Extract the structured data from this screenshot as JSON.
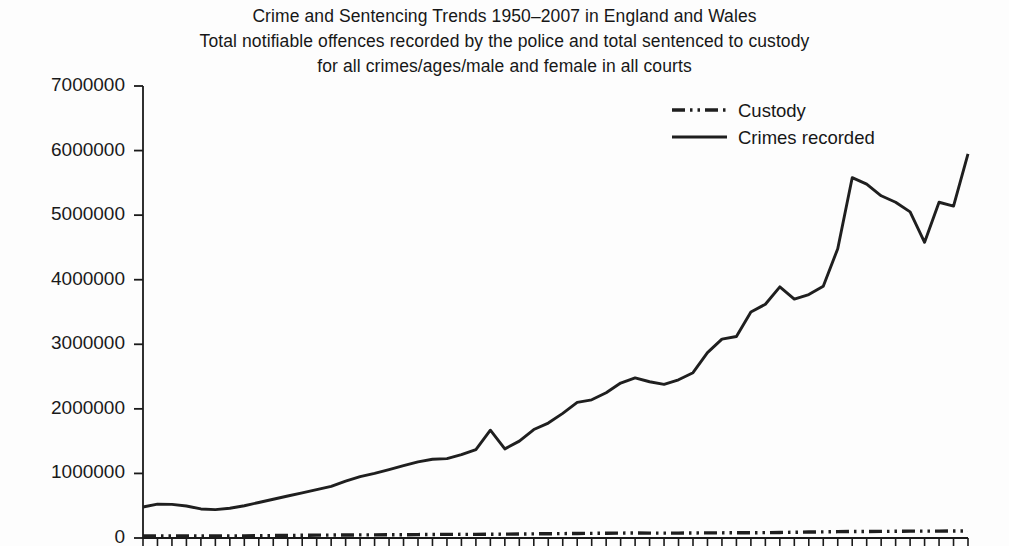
{
  "chart_data": {
    "type": "line",
    "title": "Crime and Sentencing Trends 1950–2007 in England and Wales",
    "subtitle_line2": "Total notifiable offences recorded by the police and total sentenced to custody",
    "subtitle_line3": "for all crimes/ages/male and female in all courts",
    "xlabel": "",
    "ylabel": "",
    "ylim": [
      0,
      7000000
    ],
    "xlim": [
      1950,
      2007
    ],
    "grid": false,
    "legend_position": "top-right",
    "ytick_labels": [
      "7000000",
      "6000000",
      "5000000",
      "4000000",
      "3000000",
      "2000000",
      "1000000",
      "0"
    ],
    "ytick_values": [
      7000000,
      6000000,
      5000000,
      4000000,
      3000000,
      2000000,
      1000000,
      0
    ],
    "x": [
      1950,
      1951,
      1952,
      1953,
      1954,
      1955,
      1956,
      1957,
      1958,
      1959,
      1960,
      1961,
      1962,
      1963,
      1964,
      1965,
      1966,
      1967,
      1968,
      1969,
      1970,
      1971,
      1972,
      1973,
      1974,
      1975,
      1976,
      1977,
      1978,
      1979,
      1980,
      1981,
      1982,
      1983,
      1984,
      1985,
      1986,
      1987,
      1988,
      1989,
      1990,
      1991,
      1992,
      1993,
      1994,
      1995,
      1996,
      1997,
      1998,
      1999,
      2000,
      2001,
      2002,
      2003,
      2004,
      2005,
      2006,
      2007
    ],
    "series": [
      {
        "name": "Crimes recorded",
        "style": "solid",
        "color": "#1f1f1f",
        "values": [
          480000,
          525000,
          520000,
          495000,
          450000,
          440000,
          460000,
          500000,
          550000,
          600000,
          650000,
          700000,
          750000,
          800000,
          880000,
          950000,
          1000000,
          1060000,
          1120000,
          1180000,
          1220000,
          1230000,
          1290000,
          1370000,
          1670000,
          1380000,
          1500000,
          1680000,
          1780000,
          1930000,
          2100000,
          2140000,
          2250000,
          2400000,
          2480000,
          2420000,
          2380000,
          2450000,
          2560000,
          2870000,
          3080000,
          3120000,
          3500000,
          3620000,
          3890000,
          3700000,
          3770000,
          3900000,
          4480000,
          5580000,
          5480000,
          5300000,
          5200000,
          5050000,
          4580000,
          5200000,
          5140000,
          5950000
        ]
      },
      {
        "name": "Custody",
        "style": "dash-dot-dot",
        "color": "#1f1f1f",
        "values": [
          30000,
          32000,
          33000,
          31000,
          30000,
          30000,
          31000,
          33000,
          36000,
          38000,
          40000,
          42000,
          44000,
          45000,
          47000,
          48000,
          49000,
          50000,
          51000,
          53000,
          55000,
          56000,
          57000,
          56000,
          58000,
          60000,
          62000,
          64000,
          66000,
          68000,
          70000,
          72000,
          74000,
          76000,
          77000,
          76000,
          75000,
          76000,
          78000,
          80000,
          80000,
          81000,
          82000,
          83000,
          86000,
          89000,
          92000,
          95000,
          98000,
          100000,
          101000,
          102000,
          104000,
          106000,
          106000,
          107000,
          108000,
          109000
        ]
      }
    ]
  },
  "legend": {
    "entries": [
      {
        "label": "Custody",
        "style": "dash-dot-dot"
      },
      {
        "label": "Crimes recorded",
        "style": "solid"
      }
    ]
  },
  "axes": {
    "tick_color": "#1a1a1a",
    "axis_color": "#1a1a1a"
  }
}
